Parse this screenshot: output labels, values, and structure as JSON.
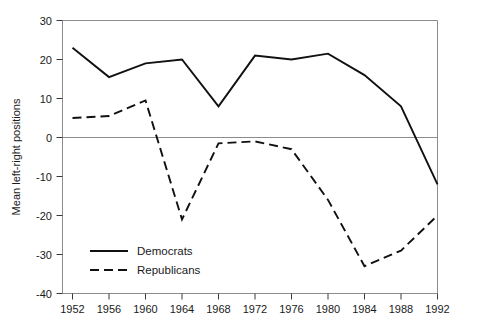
{
  "chart_data": {
    "type": "line",
    "title": "",
    "xlabel": "",
    "ylabel": "Mean left-right positions",
    "x": [
      1952,
      1956,
      1960,
      1964,
      1968,
      1972,
      1976,
      1980,
      1984,
      1988,
      1992
    ],
    "categories": [
      "1952",
      "1956",
      "1960",
      "1964",
      "1968",
      "1972",
      "1976",
      "1980",
      "1984",
      "1988",
      "1992"
    ],
    "xlim": [
      1952,
      1992
    ],
    "ylim": [
      -40,
      30
    ],
    "yticks": [
      30,
      20,
      10,
      0,
      -10,
      -20,
      -30,
      -40
    ],
    "ytick_labels": [
      "30",
      "20",
      "10",
      "0",
      "-10",
      "-20",
      "-30",
      "-40"
    ],
    "xticks": [
      1952,
      1956,
      1960,
      1964,
      1968,
      1972,
      1976,
      1980,
      1984,
      1988,
      1992
    ],
    "xtick_labels": [
      "1952",
      "1956",
      "1960",
      "1964",
      "1968",
      "1972",
      "1976",
      "1980",
      "1984",
      "1988",
      "1992"
    ],
    "grid": false,
    "zero_line": true,
    "legend_position": "lower-left-inside",
    "series": [
      {
        "name": "Democrats",
        "style": "solid",
        "color": "#111111",
        "values": [
          23,
          15.5,
          19,
          20,
          8,
          21,
          20,
          21.5,
          16,
          8,
          -12
        ]
      },
      {
        "name": "Republicans",
        "style": "dashed",
        "color": "#111111",
        "values": [
          5,
          5.5,
          9.5,
          -21,
          -1.5,
          -1,
          -3,
          -16,
          -33,
          -29,
          -20
        ]
      }
    ]
  },
  "legend": {
    "items": [
      {
        "label": "Democrats",
        "style": "solid"
      },
      {
        "label": "Republicans",
        "style": "dashed"
      }
    ]
  },
  "axes": {
    "y_title": "Mean left-right positions"
  }
}
